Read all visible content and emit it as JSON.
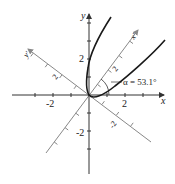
{
  "diagram": {
    "type": "rotated-axes-parabola",
    "axes": {
      "x_label": "x",
      "y_label": "y",
      "x_prime_label": "x'",
      "y_prime_label": "y'",
      "x_tick_labels": [
        "-2",
        "2"
      ],
      "y_tick_labels": [
        "2",
        "-2"
      ],
      "x_prime_tick_label": "2",
      "y_prime_tick_label": "2",
      "y_prime_neg_tick_label": "-2"
    },
    "angle_annotation": {
      "symbol": "α",
      "text": "α = 53.1°"
    },
    "colors": {
      "primary_axes": "#333333",
      "rotated_axes": "#888888",
      "curve": "#1a1a1a"
    }
  }
}
